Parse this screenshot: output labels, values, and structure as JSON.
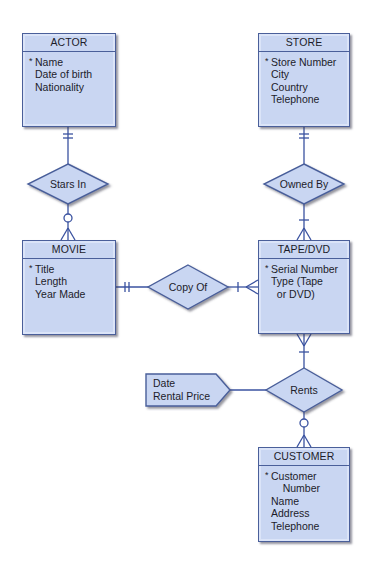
{
  "diagram": {
    "type": "entity-relationship",
    "entities": [
      {
        "id": "actor",
        "name": "ACTOR",
        "attributes": [
          {
            "text": "Name",
            "key": true
          },
          {
            "text": "Date of birth",
            "key": false
          },
          {
            "text": "Nationality",
            "key": false
          }
        ]
      },
      {
        "id": "store",
        "name": "STORE",
        "attributes": [
          {
            "text": "Store Number",
            "key": true
          },
          {
            "text": "City",
            "key": false
          },
          {
            "text": "Country",
            "key": false
          },
          {
            "text": "Telephone",
            "key": false
          }
        ]
      },
      {
        "id": "movie",
        "name": "MOVIE",
        "attributes": [
          {
            "text": "Title",
            "key": true
          },
          {
            "text": "Length",
            "key": false
          },
          {
            "text": "Year Made",
            "key": false
          }
        ]
      },
      {
        "id": "tape_dvd",
        "name": "TAPE/DVD",
        "attributes": [
          {
            "text": "Serial Number",
            "key": true
          },
          {
            "text": "Type (Tape",
            "key": false
          },
          {
            "text": "  or DVD)",
            "key": false
          }
        ]
      },
      {
        "id": "customer",
        "name": "CUSTOMER",
        "attributes": [
          {
            "text": "Customer",
            "key": true
          },
          {
            "text": "    Number",
            "key": false
          },
          {
            "text": "Name",
            "key": false
          },
          {
            "text": "Address",
            "key": false
          },
          {
            "text": "Telephone",
            "key": false
          }
        ]
      }
    ],
    "relationships": [
      {
        "id": "stars_in",
        "label": "Stars In",
        "from": "ACTOR",
        "to": "MOVIE",
        "from_cardinality": "one-and-only-one",
        "to_cardinality": "zero-or-many"
      },
      {
        "id": "owned_by",
        "label": "Owned By",
        "from": "STORE",
        "to": "TAPE/DVD",
        "from_cardinality": "one-and-only-one",
        "to_cardinality": "one-or-many"
      },
      {
        "id": "copy_of",
        "label": "Copy Of",
        "from": "MOVIE",
        "to": "TAPE/DVD",
        "from_cardinality": "one-and-only-one",
        "to_cardinality": "one-or-many"
      },
      {
        "id": "rents",
        "label": "Rents",
        "from": "TAPE/DVD",
        "to": "CUSTOMER",
        "from_cardinality": "one-or-many",
        "to_cardinality": "zero-or-many"
      }
    ],
    "relationship_attributes": {
      "relationship": "Rents",
      "lines": [
        "Date",
        "Rental Price"
      ]
    },
    "colors": {
      "fill": "#c9d6f2",
      "stroke": "#4a5f9a",
      "line": "#3a52a0",
      "text": "#1c1c2a"
    }
  }
}
